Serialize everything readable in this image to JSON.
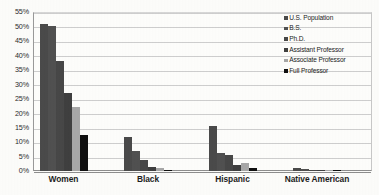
{
  "chart_data": {
    "type": "bar",
    "title": "",
    "subtitle": "",
    "xlabel": "",
    "ylabel": "",
    "ylim": [
      0,
      55
    ],
    "ytick_labels": [
      "0%",
      "5%",
      "10%",
      "15%",
      "20%",
      "25%",
      "30%",
      "35%",
      "40%",
      "45%",
      "50%",
      "55%"
    ],
    "ytick_values": [
      0,
      5,
      10,
      15,
      20,
      25,
      30,
      35,
      40,
      45,
      50,
      55
    ],
    "grid": true,
    "grid_axis": "y",
    "legend_position": "top-right",
    "categories": [
      "Women",
      "Black",
      "Hispanic",
      "Native American"
    ],
    "series": [
      {
        "name": "U.S. Population",
        "color": "#4a4a4a",
        "values": [
          51.0,
          11.8,
          15.5,
          0.9
        ]
      },
      {
        "name": "B.S.",
        "color": "#505050",
        "values": [
          50.0,
          7.0,
          6.4,
          0.7
        ]
      },
      {
        "name": "Ph.D.",
        "color": "#474747",
        "values": [
          38.0,
          3.8,
          5.5,
          0.5
        ]
      },
      {
        "name": "Assistant Professor",
        "color": "#3f3f3f",
        "values": [
          27.0,
          1.5,
          2.0,
          0.4
        ]
      },
      {
        "name": "Associate Professor",
        "color": "#a8a8a8",
        "values": [
          22.0,
          0.9,
          2.9,
          0.3
        ]
      },
      {
        "name": "Full Professor",
        "color": "#101010",
        "values": [
          12.5,
          0.5,
          1.0,
          0.3
        ]
      }
    ]
  }
}
